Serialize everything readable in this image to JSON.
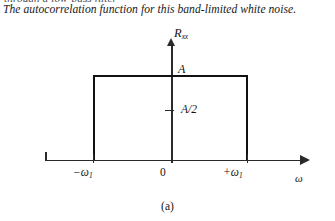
{
  "page": {
    "cutoff_line_above": "through a low-pass filter",
    "lede_text": "The autocorrelation function for this band-limited white noise."
  },
  "figure": {
    "caption": "(a)",
    "y_axis_label_main": "R",
    "y_axis_label_sub": "xx",
    "x_axis_label": "ω",
    "value_labels": {
      "peak": "A",
      "half": "A/2"
    },
    "x_ticks": [
      {
        "label_sign": "−",
        "label_base": "ω",
        "label_sub": "1"
      },
      {
        "label_sign": "",
        "label_base": "0",
        "label_sub": ""
      },
      {
        "label_sign": "+",
        "label_base": "ω",
        "label_sub": "1"
      }
    ],
    "x_tick_labels": {
      "negative": "−ω",
      "zero": "0",
      "positive": "+ω",
      "subscript": "1"
    },
    "colors": {
      "curve": "#111111",
      "axis": "#2a2a2a",
      "text": "#141414",
      "background": "#ffffff"
    }
  },
  "chart_data": {
    "type": "area",
    "title": "",
    "subtitle": "",
    "xlabel": "ω",
    "ylabel": "R_xx",
    "xlim": [
      -1.7,
      2.1
    ],
    "ylim": [
      0,
      1.18
    ],
    "grid": false,
    "legend": null,
    "x": [
      -1.7,
      -1.0,
      -1.0,
      1.0,
      1.0,
      2.1
    ],
    "y": [
      0,
      0,
      1.0,
      1.0,
      0,
      0
    ],
    "annotations": [
      {
        "text": "A",
        "x": 0.05,
        "y": 1.0,
        "note": "amplitude of the rectangular band"
      },
      {
        "text": "A/2",
        "x": 0.12,
        "y": 0.5,
        "note": "half-amplitude reference tick on the vertical axis"
      },
      {
        "text": "−ω1",
        "x": -1.0,
        "y": 0,
        "note": "lower band edge tick"
      },
      {
        "text": "0",
        "x": 0.0,
        "y": 0,
        "note": "origin tick"
      },
      {
        "text": "+ω1",
        "x": 1.0,
        "y": 0,
        "note": "upper band edge tick"
      }
    ],
    "xtick_positions": [
      -1.0,
      0.0,
      1.0
    ],
    "xtick_labels": [
      "−ω1",
      "0",
      "+ω1"
    ],
    "ytick_positions": [
      0.5
    ],
    "ytick_labels": [
      "A/2"
    ]
  }
}
